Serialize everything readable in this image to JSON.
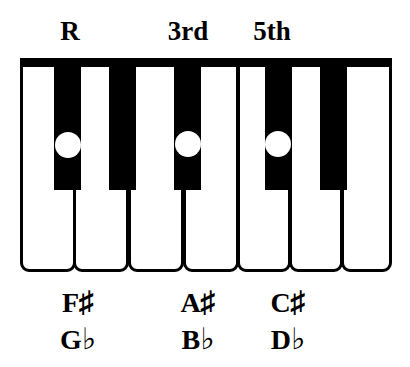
{
  "diagram": {
    "title_labels": [
      {
        "text": "R",
        "x": 48,
        "width": 44
      },
      {
        "text": "3rd",
        "x": 158,
        "width": 60
      },
      {
        "text": "5th",
        "x": 242,
        "width": 60
      }
    ],
    "top_label_y": 18,
    "colors": {
      "key_white": "#ffffff",
      "key_black": "#000000",
      "outline": "#000000",
      "marker": "#ffffff"
    },
    "keyboard": {
      "white_keys": [
        {
          "name": "white-key-1",
          "x": 0,
          "width": 56
        },
        {
          "name": "white-key-2",
          "x": 53,
          "width": 56
        },
        {
          "name": "white-key-3",
          "x": 108,
          "width": 56
        },
        {
          "name": "white-key-4",
          "x": 163,
          "width": 56
        },
        {
          "name": "white-key-5",
          "x": 217,
          "width": 54
        },
        {
          "name": "white-key-6",
          "x": 269,
          "width": 54
        },
        {
          "name": "white-key-7",
          "x": 321,
          "width": 51
        }
      ],
      "black_keys": [
        {
          "name": "black-key-f-sharp",
          "x": 34,
          "width": 27,
          "selected": true
        },
        {
          "name": "black-key-g-sharp",
          "x": 89,
          "width": 27,
          "selected": false
        },
        {
          "name": "black-key-a-sharp",
          "x": 154,
          "width": 27,
          "selected": true
        },
        {
          "name": "black-key-c-sharp",
          "x": 245,
          "width": 27,
          "selected": true
        },
        {
          "name": "black-key-d-sharp",
          "x": 300,
          "width": 27,
          "selected": false
        }
      ],
      "dots": [
        {
          "name": "note-dot-root",
          "x": 35,
          "y": 74
        },
        {
          "name": "note-dot-third",
          "x": 155,
          "y": 73
        },
        {
          "name": "note-dot-fifth",
          "x": 245,
          "y": 73
        }
      ]
    },
    "note_names": [
      {
        "sharp": "F",
        "sharp_symbol": "♯",
        "flat": "G",
        "flat_symbol": "♭",
        "x": 48,
        "width": 60
      },
      {
        "sharp": "A",
        "sharp_symbol": "♯",
        "flat": "B",
        "flat_symbol": "♭",
        "x": 168,
        "width": 60
      },
      {
        "sharp": "C",
        "sharp_symbol": "♯",
        "flat": "D",
        "flat_symbol": "♭",
        "x": 258,
        "width": 60
      }
    ],
    "note_name_rows": {
      "sharp_y": 287,
      "flat_y": 324
    }
  }
}
